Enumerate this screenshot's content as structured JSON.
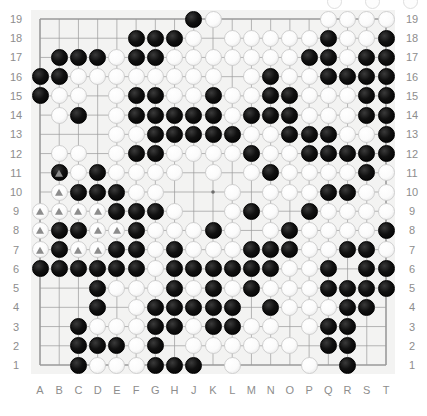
{
  "app": {
    "title": "go-board-position",
    "board_size": 19,
    "colors": {
      "board_background": "#f3f3f2",
      "grid_line": "#9a9a9a",
      "label_text": "#8d8d8d",
      "black_stone": "#000000",
      "white_stone": "#fdfdfd",
      "mark_triangle": "#8c8c8c"
    }
  },
  "labels": {
    "columns": [
      "A",
      "B",
      "C",
      "D",
      "E",
      "F",
      "G",
      "H",
      "J",
      "K",
      "L",
      "M",
      "N",
      "O",
      "P",
      "Q",
      "R",
      "S",
      "T"
    ],
    "rows_left": [
      "19",
      "18",
      "17",
      "16",
      "15",
      "14",
      "13",
      "12",
      "11",
      "10",
      "9",
      "8",
      "7",
      "6",
      "5",
      "4",
      "3",
      "2",
      "1"
    ],
    "rows_right": [
      "19",
      "18",
      "17",
      "16",
      "15",
      "14",
      "13",
      "12",
      "11",
      "10",
      "9",
      "8",
      "7",
      "6",
      "5",
      "4",
      "3",
      "2",
      "1"
    ]
  },
  "board": {
    "star_points": [
      {
        "col": "D",
        "row": 16
      },
      {
        "col": "K",
        "row": 16
      },
      {
        "col": "Q",
        "row": 16
      },
      {
        "col": "D",
        "row": 10
      },
      {
        "col": "K",
        "row": 10
      },
      {
        "col": "Q",
        "row": 10
      },
      {
        "col": "D",
        "row": 4
      },
      {
        "col": "K",
        "row": 4
      },
      {
        "col": "Q",
        "row": 4
      }
    ],
    "rows": [
      {
        "row": 19,
        "cells": "........BW.....WWWW"
      },
      {
        "row": 18,
        "cells": ".....BBBW.WWWWWBWWB"
      },
      {
        "row": 17,
        "cells": ".BBBWBBWWWWWWWBBWBB"
      },
      {
        "row": 16,
        "cells": "BBWWWWWWWW.WBWWBBBB"
      },
      {
        "row": 15,
        "cells": "BWW.WBBWWBWWBBWWWBB"
      },
      {
        "row": 14,
        "cells": ".WB.WBBBBBWBBBWWWBB"
      },
      {
        "row": 13,
        "cells": "....WWBBBBBWWBBBWWB"
      },
      {
        "row": 12,
        "cells": ".WW.WBBWWWWBWWBBBBB"
      },
      {
        "row": 11,
        "cells": ".BWBWWWW.W.WBWWWWBW"
      },
      {
        "row": 10,
        "cells": ".WBBBWW...W.WWWBBWW"
      },
      {
        "row": 9,
        "cells": "WWWWBBBW..WBW.BWWWW"
      },
      {
        "row": 8,
        "cells": "WBBWWBWWWBW.WBWWWWB"
      },
      {
        "row": 7,
        "cells": "WBWWBBWBWWWBBBWWBBW"
      },
      {
        "row": 6,
        "cells": "BBBBBBWBBBBBBWWB.BB"
      },
      {
        "row": 5,
        "cells": "...BWWWBWBWBWWWBBBB"
      },
      {
        "row": 4,
        "cells": "...B.WBBBBB.BWWWBB."
      },
      {
        "row": 3,
        "cells": "..BWWWBBWBBWW.WBB.."
      },
      {
        "row": 2,
        "cells": "..BBBWB.WWWWWW.BB.."
      },
      {
        "row": 1,
        "cells": "..BWWWBBB.W...W.B.."
      }
    ],
    "marked_stones": [
      {
        "col": "B",
        "row": 11,
        "color": "black",
        "mark": "triangle"
      },
      {
        "col": "B",
        "row": 10,
        "color": "white",
        "mark": "triangle"
      },
      {
        "col": "A",
        "row": 9,
        "color": "white",
        "mark": "triangle"
      },
      {
        "col": "B",
        "row": 9,
        "color": "white",
        "mark": "triangle"
      },
      {
        "col": "C",
        "row": 9,
        "color": "white",
        "mark": "triangle"
      },
      {
        "col": "D",
        "row": 9,
        "color": "white",
        "mark": "triangle"
      },
      {
        "col": "A",
        "row": 8,
        "color": "white",
        "mark": "triangle"
      },
      {
        "col": "D",
        "row": 8,
        "color": "white",
        "mark": "triangle"
      },
      {
        "col": "E",
        "row": 8,
        "color": "white",
        "mark": "triangle"
      },
      {
        "col": "A",
        "row": 7,
        "color": "white",
        "mark": "triangle"
      },
      {
        "col": "C",
        "row": 7,
        "color": "white",
        "mark": "triangle"
      },
      {
        "col": "D",
        "row": 7,
        "color": "white",
        "mark": "triangle"
      }
    ]
  },
  "top_fragment": {
    "visible": true,
    "description": "partially-cropped white stones at top-right edge",
    "count": 3
  }
}
